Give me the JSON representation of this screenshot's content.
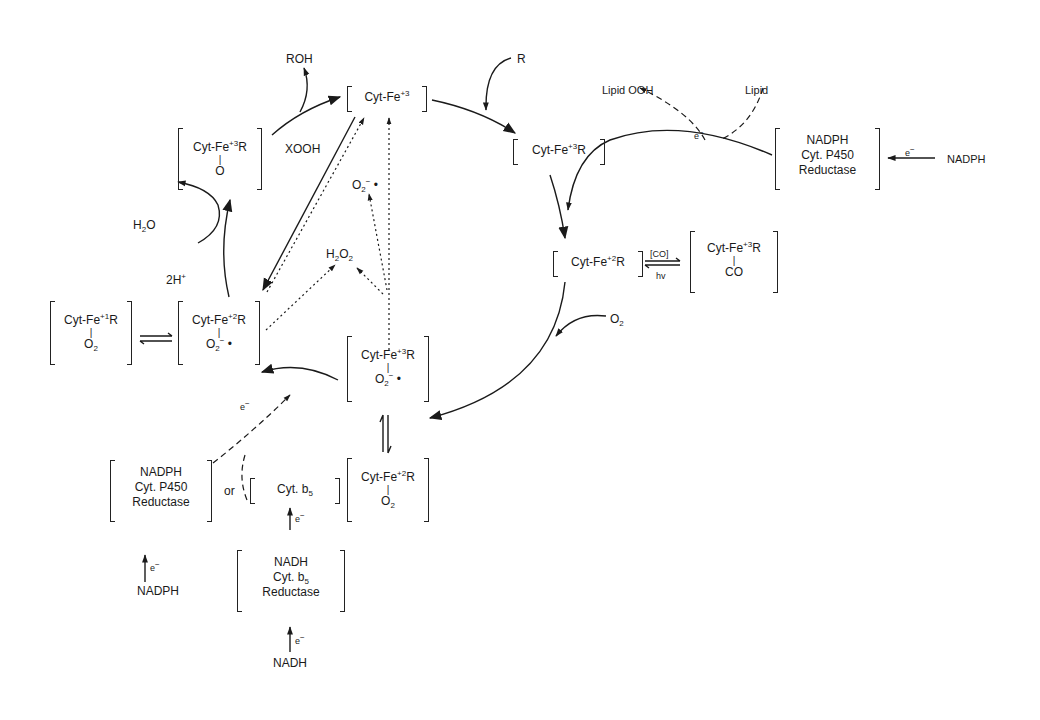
{
  "diagram": {
    "title": "",
    "type": "cytochrome P450 catalytic cycle",
    "colors": {
      "ink": "#1a1a1a",
      "background": "#ffffff"
    },
    "species": {
      "fe3": {
        "main": "Cyt-Fe",
        "sup": "+3",
        "tail": ""
      },
      "fe3R": {
        "main": "Cyt-Fe",
        "sup": "+3",
        "tail": "R"
      },
      "fe2R": {
        "main": "Cyt-Fe",
        "sup": "+2",
        "tail": "R"
      },
      "fe3R_CO": {
        "main": "Cyt-Fe",
        "sup": "+3",
        "tail": "R",
        "bond": "|",
        "ligand": "CO"
      },
      "fe3R_O2rad": {
        "main": "Cyt-Fe",
        "sup": "+3",
        "tail": "R",
        "bond": "|",
        "ligand": "O",
        "ligand_sub": "2",
        "ligand_sup": "−",
        "radical": "•"
      },
      "fe2R_O2": {
        "main": "Cyt-Fe",
        "sup": "+2",
        "tail": "R",
        "bond": "|",
        "ligand": "O",
        "ligand_sub": "2"
      },
      "fe2R_O2rad": {
        "main": "Cyt-Fe",
        "sup": "+2",
        "tail": "R",
        "bond": "|",
        "ligand": "O",
        "ligand_sub": "2",
        "ligand_sup": "−",
        "radical": "•"
      },
      "fe1R_O2": {
        "main": "Cyt-Fe",
        "sup": "+1",
        "tail": "R",
        "bond": "|",
        "ligand": "O",
        "ligand_sub": "2"
      },
      "fe3R_O": {
        "main": "Cyt-Fe",
        "sup": "+3",
        "tail": "R",
        "bond": "|",
        "ligand": "O"
      }
    },
    "labels": {
      "roh": "ROH",
      "r": "R",
      "xooh": "XOOH",
      "lipid_ooh": "Lipid OOH",
      "lipid": "Lipid",
      "o2_in": {
        "main": "O",
        "sub": "2"
      },
      "h2o": {
        "a": "H",
        "sub": "2",
        "b": "O"
      },
      "two_h": {
        "main": "2H",
        "sup": "+"
      },
      "h2o2": {
        "a": "H",
        "sub1": "2",
        "b": "O",
        "sub2": "2"
      },
      "superoxide": {
        "main": "O",
        "sub": "2",
        "sup": "−",
        "radical": "•"
      },
      "co": "[CO]",
      "hv": "hv",
      "or": "or",
      "electron": {
        "main": "e",
        "sup": "−"
      },
      "nadph_right": "NADPH",
      "nadph_left": "NADPH",
      "nadh": "NADH"
    },
    "enzymes": {
      "p450_reductase_right": [
        "NADPH",
        "Cyt. P450",
        "Reductase"
      ],
      "p450_reductase_left": [
        "NADPH",
        "Cyt. P450",
        "Reductase"
      ],
      "cyt_b5": {
        "main": "Cyt. b",
        "sub": "5"
      },
      "b5_reductase": {
        "line1": "NADH",
        "line2_main": "Cyt. b",
        "line2_sub": "5",
        "line3": "Reductase"
      }
    }
  }
}
